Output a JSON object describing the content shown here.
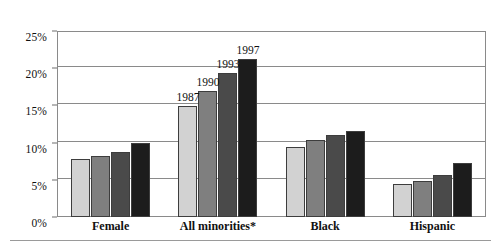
{
  "chart_data": {
    "type": "bar",
    "title": "",
    "subtitle": "",
    "xlabel": "",
    "ylabel": "",
    "categories": [
      "Female",
      "All minorities*",
      "Black",
      "Hispanic"
    ],
    "series": [
      {
        "name": "1987",
        "color": "#d2d2d2",
        "values": [
          7.8,
          14.9,
          9.4,
          4.4
        ]
      },
      {
        "name": "1990",
        "color": "#7f7f7f",
        "values": [
          8.2,
          17.0,
          10.3,
          4.9
        ]
      },
      {
        "name": "1993",
        "color": "#4a4a4a",
        "values": [
          8.7,
          19.3,
          11.0,
          5.7
        ]
      },
      {
        "name": "1997",
        "color": "#1c1c1c",
        "values": [
          10.0,
          21.3,
          11.6,
          7.2
        ]
      }
    ],
    "ylim": [
      0,
      25
    ],
    "ytick_values": [
      0,
      5,
      10,
      15,
      20,
      25
    ],
    "ytick_labels": [
      "0%",
      "5%",
      "10%",
      "15%",
      "20%",
      "25%"
    ],
    "grid": "horizontal",
    "legend_position": "none",
    "annotations": [
      {
        "text": "1987",
        "series": "1987",
        "category": "All minorities*"
      },
      {
        "text": "1990",
        "series": "1990",
        "category": "All minorities*"
      },
      {
        "text": "1993",
        "series": "1993",
        "category": "All minorities*"
      },
      {
        "text": "1997",
        "series": "1997",
        "category": "All minorities*"
      }
    ],
    "footnote_marker": "*"
  },
  "top_clip_text": "·"
}
